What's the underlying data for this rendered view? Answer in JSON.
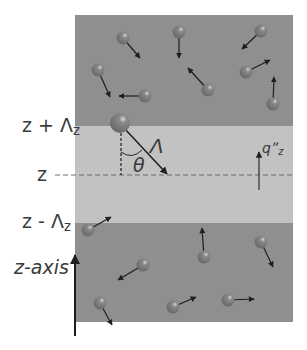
{
  "labels": {
    "z_plus": "z + Λ",
    "z_plus_sub": "z",
    "z": "z",
    "z_minus": "z - Λ",
    "z_minus_sub": "z",
    "z_axis": "z-axis",
    "lambda": "Λ",
    "theta": "θ",
    "q_flux": "qˮ",
    "q_flux_sub": "z"
  },
  "colors": {
    "outer_region": "#8f8f8f",
    "middle_band": "#c2c2c2",
    "particle": "#7a7a7a",
    "arrow": "#1e1e1e",
    "text": "#3a3a3a"
  },
  "geometry": {
    "box": {
      "x": 75,
      "y": 15,
      "w": 218,
      "h": 307
    },
    "band": {
      "y_top": 126,
      "y_bottom": 223
    },
    "z_line_y": 175
  },
  "particles_top": [
    {
      "cx": 123,
      "cy": 38,
      "tx": 140,
      "ty": 58
    },
    {
      "cx": 179,
      "cy": 32,
      "tx": 179,
      "ty": 58
    },
    {
      "cx": 98,
      "cy": 70,
      "tx": 110,
      "ty": 97
    },
    {
      "cx": 145,
      "cy": 96,
      "tx": 119,
      "ty": 96
    },
    {
      "cx": 261,
      "cy": 31,
      "tx": 242,
      "ty": 49
    },
    {
      "cx": 246,
      "cy": 72,
      "tx": 270,
      "ty": 60
    },
    {
      "cx": 208,
      "cy": 90,
      "tx": 188,
      "ty": 68
    },
    {
      "cx": 273,
      "cy": 104,
      "tx": 274,
      "ty": 77
    }
  ],
  "particles_bottom": [
    {
      "cx": 88,
      "cy": 230,
      "tx": 111,
      "ty": 217
    },
    {
      "cx": 143,
      "cy": 265,
      "tx": 118,
      "ty": 280
    },
    {
      "cx": 100,
      "cy": 303,
      "tx": 112,
      "ty": 325
    },
    {
      "cx": 173,
      "cy": 307,
      "tx": 196,
      "ty": 297
    },
    {
      "cx": 204,
      "cy": 257,
      "tx": 202,
      "ty": 228
    },
    {
      "cx": 261,
      "cy": 242,
      "tx": 273,
      "ty": 267
    },
    {
      "cx": 228,
      "cy": 300,
      "tx": 254,
      "ty": 299
    }
  ],
  "big_particle": {
    "cx": 120,
    "cy": 123,
    "r": 10,
    "tx": 167,
    "ty": 174
  }
}
